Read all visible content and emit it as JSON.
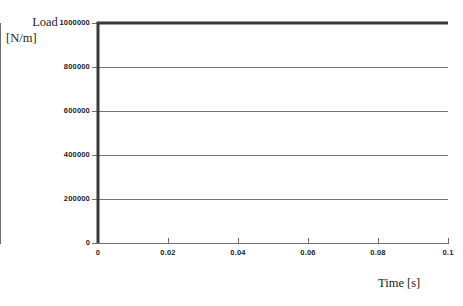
{
  "chart_data": {
    "type": "line",
    "title": "",
    "xlabel": "Time [s]",
    "ylabel": "Load [N/m]",
    "ylabel_line1": "Load",
    "ylabel_line2": "[N/m]",
    "xlim": [
      0,
      0.1
    ],
    "ylim": [
      0,
      1000000
    ],
    "grid": true,
    "grid_axis": "y",
    "legend": null,
    "xticks": [
      0,
      0.02,
      0.04,
      0.06,
      0.08,
      0.1
    ],
    "xticklabels": [
      "0",
      "0.02",
      "0.04",
      "0.06",
      "0.08",
      "0.1"
    ],
    "yticks": [
      0,
      200000,
      400000,
      600000,
      800000,
      1000000
    ],
    "yticklabels": [
      "0",
      "200000",
      "400000",
      "600000",
      "800000",
      "1000000"
    ],
    "series": [
      {
        "name": "Load",
        "color": "#3a3a3a",
        "linewidth": 3,
        "x": [
          0,
          0,
          0.1
        ],
        "values": [
          0,
          1000000,
          1000000
        ]
      }
    ]
  },
  "style": {
    "line_color": "#3a3a3a",
    "grid_color": "#777777",
    "axis_color": "#6e6e6e",
    "text_color": "#1c1c1c",
    "tick_label_color": "#232323",
    "background": "#ffffff"
  }
}
